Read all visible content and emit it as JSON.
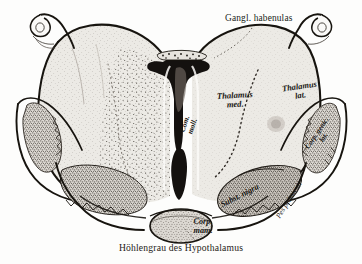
{
  "figure": {
    "kind": "anatomical-illustration",
    "caption": "Höhlengrau des Hypothalamus",
    "background_color": "#fdfdfc",
    "ink_color": "#191714",
    "tissue_fill": "#e8e6e1",
    "stipple_color": "#5d5751",
    "ventricle_color": "#14110f"
  },
  "labels": {
    "gangl_habenulae": "Gangl. habenulas",
    "thalamus_med_line1": "Thalamus",
    "thalamus_med_line2": "med.",
    "thalamus_lat_line1": "Thalamus",
    "thalamus_lat_line2": "lat.",
    "com_moll_line1": "Com.",
    "com_moll_line2": "moll.",
    "subst_nigra": "Subst. nigra",
    "pes_pedunculi": "Pes pedunculi",
    "corp_genic_lat_line1": "Corp. genic.",
    "corp_genic_lat_line2": "lat.",
    "corp_mam_line1": "Corp.",
    "corp_mam_line2": "mam.",
    "caption": "Höhlengrau des Hypothalamus"
  },
  "structures": [
    {
      "name": "thalamus-left-hemisphere",
      "side": "left",
      "shading": "light-gray-with-stipple"
    },
    {
      "name": "thalamus-right-hemisphere",
      "side": "right",
      "shading": "light-gray"
    },
    {
      "name": "third-ventricle",
      "side": "midline",
      "shading": "solid-black"
    },
    {
      "name": "ganglion-habenulae-left",
      "side": "left",
      "shading": "outline-loop"
    },
    {
      "name": "ganglion-habenulae-right",
      "side": "right",
      "shading": "outline-loop"
    },
    {
      "name": "corpus-geniculatum-laterale-left",
      "side": "left",
      "shading": "dense-stipple"
    },
    {
      "name": "corpus-geniculatum-laterale-right",
      "side": "right",
      "shading": "dense-stipple"
    },
    {
      "name": "substantia-nigra-left",
      "side": "left",
      "shading": "dense-stipple-band"
    },
    {
      "name": "substantia-nigra-right",
      "side": "right",
      "shading": "dense-stipple-band"
    },
    {
      "name": "pes-pedunculi-left",
      "side": "left",
      "shading": "unshaded"
    },
    {
      "name": "pes-pedunculi-right",
      "side": "right",
      "shading": "unshaded"
    },
    {
      "name": "corpus-mamillare",
      "side": "midline",
      "shading": "medium-stipple"
    },
    {
      "name": "medial-lateral-thalamus-boundary",
      "side": "both",
      "shading": "dotted-line"
    }
  ]
}
